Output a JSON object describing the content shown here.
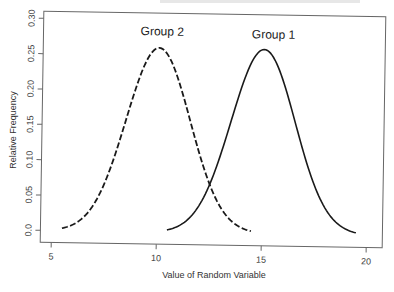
{
  "chart_data": {
    "type": "line",
    "title": "",
    "xlabel": "Value of Random Variable",
    "ylabel": "Relative Frequency",
    "xlim": [
      4.5,
      20.5
    ],
    "ylim": [
      0.0,
      0.3
    ],
    "x_ticks": [
      5,
      10,
      15,
      20
    ],
    "x_tick_labels": [
      "5",
      "10",
      "15",
      "20"
    ],
    "y_ticks": [
      0.0,
      0.05,
      0.1,
      0.15,
      0.2,
      0.25,
      0.3
    ],
    "y_tick_labels": [
      "0.0",
      "0.05",
      "0.10",
      "0.15",
      "0.20",
      "0.25",
      "0.30"
    ],
    "grid": false,
    "legend": "none (curves labeled directly)",
    "series": [
      {
        "name": "Group 2",
        "line_style": "dashed",
        "distribution": "normal",
        "mean": 10,
        "sd": 1.53,
        "x_range": [
          5.5,
          14.5
        ],
        "x": [
          5.5,
          6.5,
          7.5,
          8.5,
          9.0,
          9.5,
          10.0,
          10.5,
          11.0,
          11.5,
          12.5,
          13.5,
          14.5
        ],
        "values": [
          0.0033,
          0.0189,
          0.0685,
          0.1618,
          0.2099,
          0.2472,
          0.2608,
          0.2472,
          0.2099,
          0.1618,
          0.0685,
          0.0189,
          0.0033
        ],
        "label_position": [
          9.1,
          0.27
        ]
      },
      {
        "name": "Group 1",
        "line_style": "solid",
        "distribution": "normal",
        "mean": 15,
        "sd": 1.53,
        "x_range": [
          10.5,
          19.5
        ],
        "x": [
          10.5,
          11.5,
          12.5,
          13.5,
          14.0,
          14.5,
          15.0,
          15.5,
          16.0,
          16.5,
          17.5,
          18.5,
          19.5
        ],
        "values": [
          0.0033,
          0.0189,
          0.0685,
          0.1618,
          0.2099,
          0.2472,
          0.2608,
          0.2472,
          0.2099,
          0.1618,
          0.0685,
          0.0189,
          0.0033
        ],
        "label_position": [
          14.4,
          0.268
        ]
      }
    ],
    "annotations": [
      "Group 2",
      "Group 1"
    ]
  },
  "labels": {
    "group2": "Group 2",
    "group1": "Group 1",
    "xlabel": "Value of Random Variable",
    "ylabel": "Relative Frequency",
    "x_ticks": [
      "5",
      "10",
      "15",
      "20"
    ],
    "y_ticks": [
      "0.0",
      "0.05",
      "0.10",
      "0.15",
      "0.20",
      "0.25",
      "0.30"
    ]
  },
  "colors": {
    "curve": "#1a1a1a",
    "frame": "#555555",
    "text": "#333333"
  }
}
